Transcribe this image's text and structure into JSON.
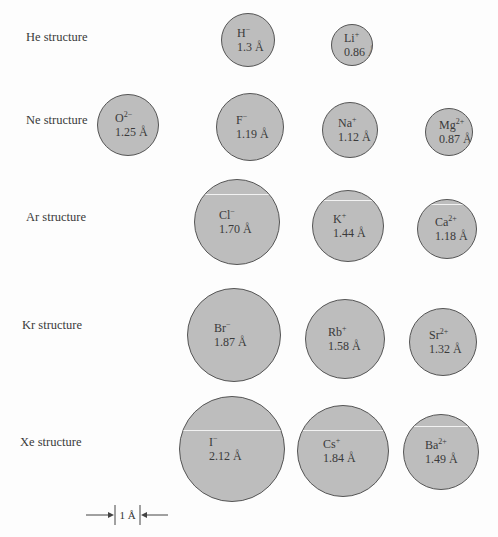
{
  "rows": [
    {
      "label": "He structure",
      "x": 26,
      "y": 30
    },
    {
      "label": "Ne structure",
      "x": 26,
      "y": 113
    },
    {
      "label": "Ar structure",
      "x": 26,
      "y": 210
    },
    {
      "label": "Kr structure",
      "x": 22,
      "y": 318
    },
    {
      "label": "Xe structure",
      "x": 20,
      "y": 435
    }
  ],
  "ions": [
    {
      "symbol": "H",
      "charge": "−",
      "radius_label": "1.3 Å",
      "radius": 1.3,
      "cx": 248,
      "cy": 40,
      "r": 27
    },
    {
      "symbol": "Li",
      "charge": "+",
      "radius_label": "0.86 Å",
      "radius": 0.86,
      "cx": 352,
      "cy": 45,
      "r": 21
    },
    {
      "symbol": "O",
      "charge": "2−",
      "radius_label": "1.25 Å",
      "radius": 1.25,
      "cx": 128,
      "cy": 125,
      "r": 31
    },
    {
      "symbol": "F",
      "charge": "−",
      "radius_label": "1.19 Å",
      "radius": 1.19,
      "cx": 250,
      "cy": 127,
      "r": 34
    },
    {
      "symbol": "Na",
      "charge": "+",
      "radius_label": "1.12 Å",
      "radius": 1.12,
      "cx": 350,
      "cy": 130,
      "r": 28
    },
    {
      "symbol": "Mg",
      "charge": "2+",
      "radius_label": "0.87 Å",
      "radius": 0.87,
      "cx": 449,
      "cy": 132,
      "r": 24
    },
    {
      "symbol": "Cl",
      "charge": "−",
      "radius_label": "1.70 Å",
      "radius": 1.7,
      "cx": 237,
      "cy": 222,
      "r": 43,
      "hl": 14
    },
    {
      "symbol": "K",
      "charge": "+",
      "radius_label": "1.44 Å",
      "radius": 1.44,
      "cx": 348,
      "cy": 226,
      "r": 36,
      "hl": 9
    },
    {
      "symbol": "Ca",
      "charge": "2+",
      "radius_label": "1.18 Å",
      "radius": 1.18,
      "cx": 447,
      "cy": 229,
      "r": 30,
      "hl": 4
    },
    {
      "symbol": "Br",
      "charge": "−",
      "radius_label": "1.87 Å",
      "radius": 1.87,
      "cx": 234,
      "cy": 335,
      "r": 47
    },
    {
      "symbol": "Rb",
      "charge": "+",
      "radius_label": "1.58 Å",
      "radius": 1.58,
      "cx": 345,
      "cy": 339,
      "r": 40
    },
    {
      "symbol": "Sr",
      "charge": "2+",
      "radius_label": "1.32 Å",
      "radius": 1.32,
      "cx": 443,
      "cy": 342,
      "r": 34
    },
    {
      "symbol": "I",
      "charge": "−",
      "radius_label": "2.12 Å",
      "radius": 2.12,
      "cx": 232,
      "cy": 449,
      "r": 53,
      "hl": 33
    },
    {
      "symbol": "Cs",
      "charge": "+",
      "radius_label": "1.84 Å",
      "radius": 1.84,
      "cx": 343,
      "cy": 451,
      "r": 46,
      "hl": 24
    },
    {
      "symbol": "Ba",
      "charge": "2+",
      "radius_label": "1.49 Å",
      "radius": 1.49,
      "cx": 441,
      "cy": 452,
      "r": 38,
      "hl": 11
    }
  ],
  "scale_bar": {
    "label": "1 Å"
  },
  "colors": {
    "ion_fill": "#bdbdbd",
    "ion_stroke": "#555555",
    "text": "#3a3a3a"
  }
}
